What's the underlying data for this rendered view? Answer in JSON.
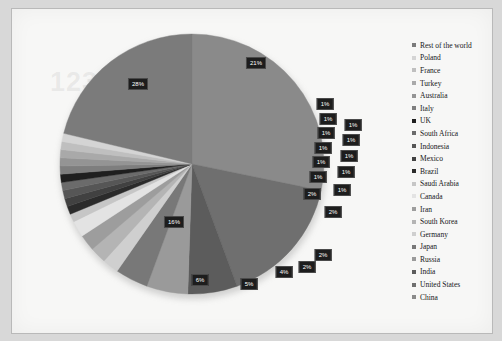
{
  "chart_data": {
    "type": "pie",
    "title": "",
    "legend_position": "right",
    "value_suffix": "%",
    "categories": [
      "China",
      "United States",
      "India",
      "Russia",
      "Japan",
      "Germany",
      "South Korea",
      "Iran",
      "Canada",
      "Saudi Arabia",
      "Brazil",
      "Mexico",
      "Indonesia",
      "South Africa",
      "UK",
      "Italy",
      "Australia",
      "Turkey",
      "France",
      "Poland",
      "Rest of the world"
    ],
    "values": [
      28,
      16,
      6,
      5,
      4,
      2,
      2,
      2,
      2,
      1,
      1,
      1,
      1,
      1,
      1,
      1,
      1,
      1,
      1,
      1,
      21
    ],
    "labels": [
      "28%",
      "16%",
      "6%",
      "5%",
      "4%",
      "2%",
      "2%",
      "2%",
      "2%",
      "1%",
      "1%",
      "1%",
      "1%",
      "1%",
      "1%",
      "1%",
      "1%",
      "1%",
      "1%",
      "1%",
      "21%"
    ],
    "colors": [
      "#8a8a8a",
      "#6f6f6f",
      "#5c5c5c",
      "#9a9a9a",
      "#787878",
      "#cfcfcf",
      "#b4b4b4",
      "#9d9d9d",
      "#e3e3e3",
      "#c6c6c6",
      "#2b2b2b",
      "#414141",
      "#565656",
      "#6b6b6b",
      "#1f1f1f",
      "#7e7e7e",
      "#949494",
      "#a9a9a9",
      "#bfbfbf",
      "#d4d4d4",
      "#7b7b7b"
    ]
  },
  "legend": {
    "items": [
      {
        "label": "Rest of the world",
        "color": "#7b7b7b"
      },
      {
        "label": "Poland",
        "color": "#d4d4d4"
      },
      {
        "label": "France",
        "color": "#bfbfbf"
      },
      {
        "label": "Turkey",
        "color": "#a9a9a9"
      },
      {
        "label": "Australia",
        "color": "#949494"
      },
      {
        "label": "Italy",
        "color": "#7e7e7e"
      },
      {
        "label": "UK",
        "color": "#1f1f1f"
      },
      {
        "label": "South Africa",
        "color": "#6b6b6b"
      },
      {
        "label": "Indonesia",
        "color": "#565656"
      },
      {
        "label": "Mexico",
        "color": "#414141"
      },
      {
        "label": "Brazil",
        "color": "#2b2b2b"
      },
      {
        "label": "Saudi Arabia",
        "color": "#c6c6c6"
      },
      {
        "label": "Canada",
        "color": "#e3e3e3"
      },
      {
        "label": "Iran",
        "color": "#9d9d9d"
      },
      {
        "label": "South Korea",
        "color": "#b4b4b4"
      },
      {
        "label": "Germany",
        "color": "#cfcfcf"
      },
      {
        "label": "Japan",
        "color": "#787878"
      },
      {
        "label": "Russia",
        "color": "#9a9a9a"
      },
      {
        "label": "India",
        "color": "#5c5c5c"
      },
      {
        "label": "United States",
        "color": "#6f6f6f"
      },
      {
        "label": "China",
        "color": "#8a8a8a"
      }
    ]
  },
  "watermark": {
    "text": "123RF"
  }
}
